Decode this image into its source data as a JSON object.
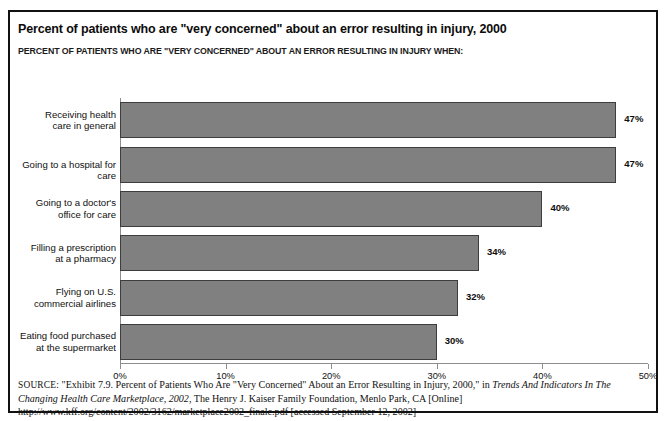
{
  "figure": {
    "title": "Percent of patients who are \"very concerned\" about an error resulting in injury, 2000",
    "subtitle": "PERCENT OF PATIENTS WHO ARE \"VERY CONCERNED\" ABOUT AN ERROR RESULTING IN INJURY WHEN:"
  },
  "chart_data": {
    "type": "bar",
    "orientation": "horizontal",
    "title": "Percent of patients who are \"very concerned\" about an error resulting in injury, 2000",
    "subtitle": "PERCENT OF PATIENTS WHO ARE \"VERY CONCERNED\" ABOUT AN ERROR RESULTING IN INJURY WHEN:",
    "xlabel": "",
    "ylabel": "",
    "categories": [
      "Receiving health\ncare in general",
      "Going to a hospital for care",
      "Going to a doctor's\noffice for care",
      "Filling a prescription\nat a pharmacy",
      "Flying on U.S.\ncommercial airlines",
      "Eating food purchased\nat the supermarket"
    ],
    "values": [
      47,
      47,
      40,
      34,
      32,
      30
    ],
    "value_labels": [
      "47%",
      "47%",
      "40%",
      "34%",
      "32%",
      "30%"
    ],
    "xlim": [
      0,
      50
    ],
    "xticks": [
      0,
      10,
      20,
      30,
      40,
      50
    ],
    "xtick_labels": [
      "0%",
      "10%",
      "20%",
      "30%",
      "40%",
      "50%"
    ],
    "grid": false,
    "legend": false,
    "bar_color": "#808080",
    "bar_edge_color": "#3d3d3d",
    "axis_color": "#8d8d8d"
  },
  "source": {
    "label": "SOURCE:",
    "text_part1": " \"Exhibit 7.9. Percent of Patients Who Are \"Very Concerned\" About an Error Resulting in Injury, 2000,\" in ",
    "italic1": "Trends And Indicators In The Changing Health Care Marketplace, 2002",
    "text_part2": ", The Henry J. Kaiser Family Foundation, Menlo Park, CA [Online] http://www.kff.org/content/2002/3162/marketplace2002_finalc.pdf [accessed September 12, 2002]"
  }
}
